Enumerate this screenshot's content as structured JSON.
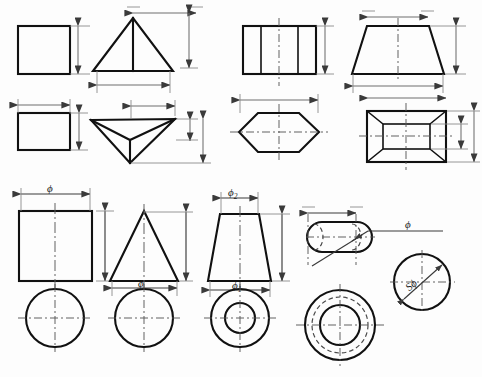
{
  "document": {
    "title": "Orthographic Projection Views of Geometric Solids",
    "type": "engineering-drawing",
    "background_color": "#fdfdfd",
    "line_color": "#111111",
    "dimension_line_color": "#6e6e6e",
    "centerline_color": "#5a5a5a"
  },
  "labels": {
    "phi": "ϕ",
    "phi_1_base": "ϕ",
    "phi_1_sub": "1",
    "phi_2_base": "ϕ",
    "phi_2_sub": "2",
    "s_phi": "Sϕ"
  },
  "figures": [
    {
      "id": "fig-1",
      "name": "square-prism-front-view",
      "shape": "square",
      "row": 1,
      "column": 1,
      "dimensions": [
        "height"
      ],
      "labels": []
    },
    {
      "id": "fig-2",
      "name": "pyramid-front-view",
      "shape": "triangle-with-center-edge",
      "row": 1,
      "column": 2,
      "dimensions": [
        "width",
        "height"
      ],
      "labels": []
    },
    {
      "id": "fig-3",
      "name": "square-prism-top-view",
      "shape": "rectangle",
      "row": 2,
      "column": 1,
      "dimensions": [
        "width",
        "height"
      ],
      "labels": []
    },
    {
      "id": "fig-4",
      "name": "pyramid-top-view",
      "shape": "inverted-pyramid-isometric",
      "row": 2,
      "column": 2,
      "dimensions": [
        "width",
        "height",
        "depth"
      ],
      "labels": []
    },
    {
      "id": "fig-5",
      "name": "hexagonal-prism-front-view",
      "shape": "rectangle-with-vertical-divisions",
      "row": 1,
      "column": 3,
      "dimensions": [
        "height"
      ],
      "labels": []
    },
    {
      "id": "fig-6",
      "name": "truncated-pyramid-front-view",
      "shape": "trapezoid",
      "row": 1,
      "column": 4,
      "dimensions": [
        "top-width",
        "bottom-width",
        "height"
      ],
      "labels": []
    },
    {
      "id": "fig-7",
      "name": "hexagonal-prism-top-view",
      "shape": "hexagon",
      "row": 2,
      "column": 3,
      "dimensions": [
        "width"
      ],
      "labels": []
    },
    {
      "id": "fig-8",
      "name": "truncated-pyramid-top-view",
      "shape": "rectangle-with-inner-rectangle",
      "row": 2,
      "column": 4,
      "dimensions": [
        "width",
        "inner-height",
        "outer-height"
      ],
      "labels": []
    },
    {
      "id": "fig-9",
      "name": "cylinder-front-view",
      "shape": "rectangle-with-centerline",
      "row": 3,
      "column": 1,
      "dimensions": [
        "diameter",
        "height"
      ],
      "labels": [
        "ϕ"
      ]
    },
    {
      "id": "fig-10",
      "name": "cone-front-view",
      "shape": "triangle-with-centerline",
      "row": 3,
      "column": 2,
      "dimensions": [
        "diameter",
        "height"
      ],
      "labels": [
        "ϕ"
      ]
    },
    {
      "id": "fig-11",
      "name": "truncated-cone-front-view",
      "shape": "trapezoid-with-centerline",
      "row": 3,
      "column": 3,
      "dimensions": [
        "top-diameter",
        "bottom-diameter"
      ],
      "labels": [
        "ϕ2",
        "ϕ1"
      ]
    },
    {
      "id": "fig-12",
      "name": "slot-capsule-front-view",
      "shape": "rounded-rectangle-with-hidden-arcs",
      "row": 3,
      "column": 4,
      "dimensions": [
        "diameter"
      ],
      "labels": [
        "ϕ"
      ],
      "leader": true
    },
    {
      "id": "fig-13",
      "name": "cylinder-top-view",
      "shape": "circle",
      "row": 4,
      "column": 1,
      "dimensions": [],
      "labels": []
    },
    {
      "id": "fig-14",
      "name": "cone-top-view",
      "shape": "circle",
      "row": 4,
      "column": 2,
      "dimensions": [
        "diameter"
      ],
      "labels": [
        "ϕ"
      ]
    },
    {
      "id": "fig-15",
      "name": "truncated-cone-top-view",
      "shape": "concentric-circles",
      "row": 4,
      "column": 3,
      "dimensions": [
        "diameter"
      ],
      "labels": [
        "ϕ1"
      ]
    },
    {
      "id": "fig-16",
      "name": "sphere-slot-top-view",
      "shape": "concentric-circles-with-hidden-circle",
      "row": 4,
      "column": 4,
      "dimensions": [],
      "labels": []
    },
    {
      "id": "fig-17",
      "name": "sphere-view",
      "shape": "circle-with-diagonal-leader",
      "row": 4,
      "column": 5,
      "dimensions": [
        "spherical-diameter"
      ],
      "labels": [
        "Sϕ"
      ]
    }
  ]
}
